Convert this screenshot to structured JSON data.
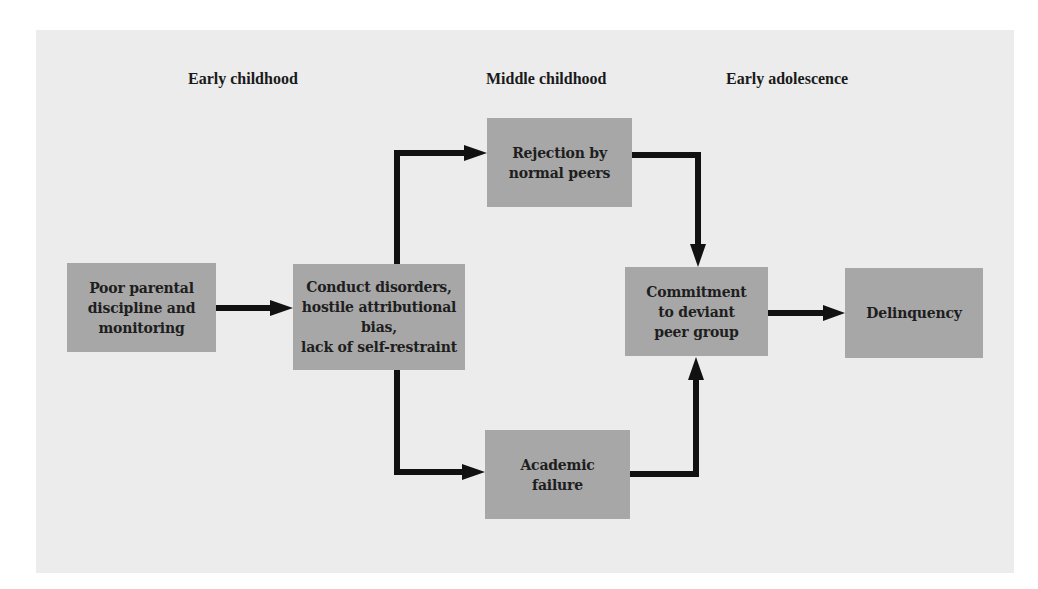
{
  "diagram": {
    "stages": [
      {
        "label": "Early childhood"
      },
      {
        "label": "Middle childhood"
      },
      {
        "label": "Early adolescence"
      }
    ],
    "nodes": [
      {
        "id": "parental",
        "label": "Poor parental\ndiscipline and\nmonitoring"
      },
      {
        "id": "conduct",
        "label": "Conduct disorders,\nhostile attributional\nbias,\nlack of self-restraint"
      },
      {
        "id": "rejection",
        "label": "Rejection by\nnormal peers"
      },
      {
        "id": "academic",
        "label": "Academic\nfailure"
      },
      {
        "id": "commitment",
        "label": "Commitment\nto deviant\npeer group"
      },
      {
        "id": "delinquency",
        "label": "Delinquency"
      }
    ],
    "edges": [
      {
        "from": "parental",
        "to": "conduct"
      },
      {
        "from": "conduct",
        "to": "rejection"
      },
      {
        "from": "conduct",
        "to": "academic"
      },
      {
        "from": "rejection",
        "to": "commitment"
      },
      {
        "from": "academic",
        "to": "commitment"
      },
      {
        "from": "commitment",
        "to": "delinquency"
      }
    ],
    "colors": {
      "background": "#ececec",
      "box_fill": "#a7a7a7",
      "arrow": "#111111",
      "text": "#1e1e1e"
    }
  }
}
